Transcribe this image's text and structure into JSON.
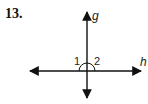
{
  "problem": {
    "number": "13."
  },
  "diagram": {
    "lines": [
      {
        "name": "g",
        "orientation": "vertical"
      },
      {
        "name": "h",
        "orientation": "horizontal"
      }
    ],
    "labels": {
      "line_g": "g",
      "line_h": "h",
      "angle_1": "1",
      "angle_2": "2"
    },
    "colors": {
      "stroke": "#111111"
    }
  }
}
